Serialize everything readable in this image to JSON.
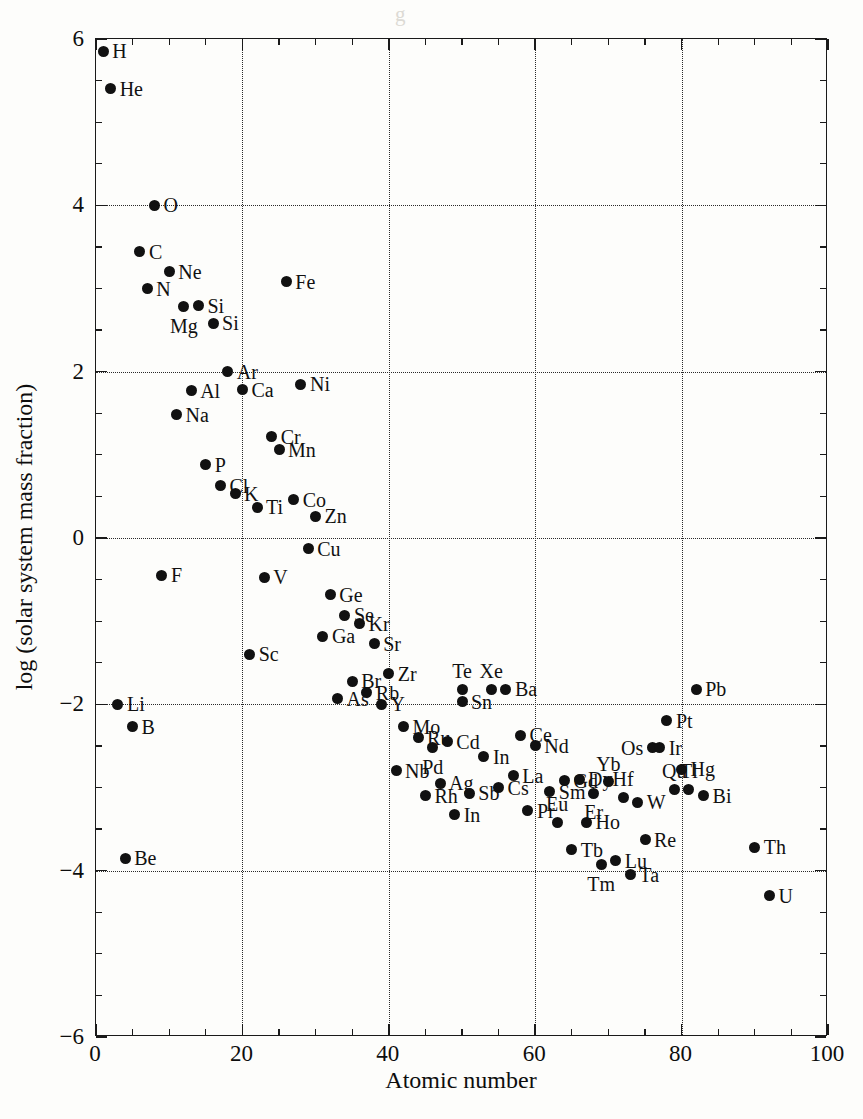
{
  "figure": {
    "background_color": "#fdfdfb",
    "point_color": "#111111",
    "axis_color": "#1a1a1a",
    "grid_color": "#2a2a2a"
  },
  "chart_data": {
    "type": "scatter",
    "title": "",
    "xlabel": "Atomic number",
    "ylabel": "log (solar system mass fraction)",
    "xlim": [
      0,
      100
    ],
    "ylim": [
      -6,
      6
    ],
    "xticks": [
      0,
      20,
      40,
      60,
      80,
      100
    ],
    "xtick_labels": [
      "0",
      "20",
      "40",
      "60",
      "80",
      "100"
    ],
    "xminor_step": 5,
    "yticks": [
      6,
      4,
      2,
      0,
      -2,
      -4,
      -6
    ],
    "ytick_labels": [
      "6",
      "4",
      "2",
      "0",
      "−2",
      "−4",
      "−6"
    ],
    "yminor_step": 0.5,
    "grid": true,
    "grid_style": "dotted",
    "grid_at": "major-ticks",
    "legend": "none",
    "points": [
      {
        "label": "H",
        "x": 1,
        "y": 5.85,
        "lab": "r"
      },
      {
        "label": "He",
        "x": 2,
        "y": 5.4,
        "lab": "r"
      },
      {
        "label": "Li",
        "x": 3,
        "y": -2.0,
        "lab": "r"
      },
      {
        "label": "Be",
        "x": 4,
        "y": -3.85,
        "lab": "r"
      },
      {
        "label": "B",
        "x": 5,
        "y": -2.27,
        "lab": "r"
      },
      {
        "label": "C",
        "x": 6,
        "y": 3.44,
        "lab": "r"
      },
      {
        "label": "N",
        "x": 7,
        "y": 3.0,
        "lab": "r"
      },
      {
        "label": "O",
        "x": 8,
        "y": 4.0,
        "lab": "r"
      },
      {
        "label": "F",
        "x": 9,
        "y": -0.45,
        "lab": "r"
      },
      {
        "label": "Ne",
        "x": 10,
        "y": 3.2,
        "lab": "r"
      },
      {
        "label": "Na",
        "x": 11,
        "y": 1.48,
        "lab": "r"
      },
      {
        "label": "Mg",
        "x": 12,
        "y": 2.78,
        "lab": "b"
      },
      {
        "label": "Al",
        "x": 13,
        "y": 1.77,
        "lab": "r"
      },
      {
        "label": "Si",
        "x": 14,
        "y": 2.79,
        "lab": "r"
      },
      {
        "label": "P",
        "x": 15,
        "y": 0.88,
        "lab": "r"
      },
      {
        "label": "Si",
        "x": 16,
        "y": 2.58,
        "lab": "r"
      },
      {
        "label": "Cl",
        "x": 17,
        "y": 0.63,
        "lab": "r"
      },
      {
        "label": "Ar",
        "x": 18,
        "y": 2.0,
        "lab": "r"
      },
      {
        "label": "K",
        "x": 19,
        "y": 0.53,
        "lab": "r"
      },
      {
        "label": "Ca",
        "x": 20,
        "y": 1.78,
        "lab": "r"
      },
      {
        "label": "Sc",
        "x": 21,
        "y": -1.4,
        "lab": "r"
      },
      {
        "label": "Ti",
        "x": 22,
        "y": 0.37,
        "lab": "r"
      },
      {
        "label": "V",
        "x": 23,
        "y": -0.47,
        "lab": "r"
      },
      {
        "label": "Cr",
        "x": 24,
        "y": 1.22,
        "lab": "r"
      },
      {
        "label": "Mn",
        "x": 25,
        "y": 1.06,
        "lab": "r"
      },
      {
        "label": "Fe",
        "x": 26,
        "y": 3.08,
        "lab": "r"
      },
      {
        "label": "Co",
        "x": 27,
        "y": 0.46,
        "lab": "r"
      },
      {
        "label": "Ni",
        "x": 28,
        "y": 1.85,
        "lab": "r"
      },
      {
        "label": "Cu",
        "x": 29,
        "y": -0.13,
        "lab": "r"
      },
      {
        "label": "Zn",
        "x": 30,
        "y": 0.26,
        "lab": "r"
      },
      {
        "label": "Ga",
        "x": 31,
        "y": -1.18,
        "lab": "r"
      },
      {
        "label": "Ge",
        "x": 32,
        "y": -0.68,
        "lab": "r"
      },
      {
        "label": "As",
        "x": 33,
        "y": -1.93,
        "lab": "r"
      },
      {
        "label": "Se",
        "x": 34,
        "y": -0.93,
        "lab": "r"
      },
      {
        "label": "Br",
        "x": 35,
        "y": -1.72,
        "lab": "r"
      },
      {
        "label": "Kr",
        "x": 36,
        "y": -1.03,
        "lab": "r"
      },
      {
        "label": "Rb",
        "x": 37,
        "y": -1.86,
        "lab": "r"
      },
      {
        "label": "Sr",
        "x": 38,
        "y": -1.27,
        "lab": "r"
      },
      {
        "label": "Y",
        "x": 39,
        "y": -2.0,
        "lab": "r"
      },
      {
        "label": "Zr",
        "x": 40,
        "y": -1.63,
        "lab": "r"
      },
      {
        "label": "Nb",
        "x": 41,
        "y": -2.8,
        "lab": "r"
      },
      {
        "label": "Mo",
        "x": 42,
        "y": -2.27,
        "lab": "r"
      },
      {
        "label": "Ru",
        "x": 44,
        "y": -2.4,
        "lab": "r"
      },
      {
        "label": "Rh",
        "x": 45,
        "y": -3.1,
        "lab": "r"
      },
      {
        "label": "Pd",
        "x": 46,
        "y": -2.52,
        "lab": "b"
      },
      {
        "label": "Ag",
        "x": 47,
        "y": -2.95,
        "lab": "r"
      },
      {
        "label": "Cd",
        "x": 48,
        "y": -2.45,
        "lab": "r"
      },
      {
        "label": "In",
        "x": 49,
        "y": -3.33,
        "lab": "r"
      },
      {
        "label": "Sb",
        "x": 51,
        "y": -3.07,
        "lab": "r"
      },
      {
        "label": "Te",
        "x": 50,
        "y": -1.82,
        "lab": "t"
      },
      {
        "label": "Sn",
        "x": 50,
        "y": -1.97,
        "lab": "r"
      },
      {
        "label": "In",
        "x": 53,
        "y": -2.63,
        "lab": "r"
      },
      {
        "label": "Xe",
        "x": 54,
        "y": -1.82,
        "lab": "t"
      },
      {
        "label": "Cs",
        "x": 55,
        "y": -3.0,
        "lab": "r"
      },
      {
        "label": "Ba",
        "x": 56,
        "y": -1.82,
        "lab": "r"
      },
      {
        "label": "La",
        "x": 57,
        "y": -2.86,
        "lab": "r"
      },
      {
        "label": "Ce",
        "x": 58,
        "y": -2.37,
        "lab": "r"
      },
      {
        "label": "Pr",
        "x": 59,
        "y": -3.28,
        "lab": "r"
      },
      {
        "label": "Nd",
        "x": 60,
        "y": -2.5,
        "lab": "r"
      },
      {
        "label": "Sm",
        "x": 62,
        "y": -3.05,
        "lab": "r"
      },
      {
        "label": "Eu",
        "x": 63,
        "y": -3.42,
        "lab": "t"
      },
      {
        "label": "Gd",
        "x": 64,
        "y": -2.92,
        "lab": "r"
      },
      {
        "label": "Tb",
        "x": 65,
        "y": -3.75,
        "lab": "r"
      },
      {
        "label": "Dy",
        "x": 66,
        "y": -2.9,
        "lab": "r"
      },
      {
        "label": "Ho",
        "x": 67,
        "y": -3.42,
        "lab": "r"
      },
      {
        "label": "Er",
        "x": 68,
        "y": -3.07,
        "lab": "b"
      },
      {
        "label": "Tm",
        "x": 69,
        "y": -3.93,
        "lab": "b"
      },
      {
        "label": "Yb",
        "x": 70,
        "y": -2.93,
        "lab": "t"
      },
      {
        "label": "Lu",
        "x": 71,
        "y": -3.88,
        "lab": "r"
      },
      {
        "label": "Hf",
        "x": 72,
        "y": -3.12,
        "lab": "t"
      },
      {
        "label": "Ta",
        "x": 73,
        "y": -4.05,
        "lab": "r"
      },
      {
        "label": "W",
        "x": 74,
        "y": -3.18,
        "lab": "r"
      },
      {
        "label": "Re",
        "x": 75,
        "y": -3.63,
        "lab": "r"
      },
      {
        "label": "Os",
        "x": 76,
        "y": -2.52,
        "lab": "l"
      },
      {
        "label": "Ir",
        "x": 77,
        "y": -2.52,
        "lab": "r"
      },
      {
        "label": "Pt",
        "x": 78,
        "y": -2.2,
        "lab": "r"
      },
      {
        "label": "Qu",
        "x": 79,
        "y": -3.02,
        "lab": "t"
      },
      {
        "label": "Hg",
        "x": 80,
        "y": -2.78,
        "lab": "r"
      },
      {
        "label": "Tl",
        "x": 81,
        "y": -3.02,
        "lab": "t"
      },
      {
        "label": "Pb",
        "x": 82,
        "y": -1.82,
        "lab": "r"
      },
      {
        "label": "Bi",
        "x": 83,
        "y": -3.1,
        "lab": "r"
      },
      {
        "label": "Th",
        "x": 90,
        "y": -3.72,
        "lab": "r"
      },
      {
        "label": "U",
        "x": 92,
        "y": -4.3,
        "lab": "r"
      }
    ]
  }
}
